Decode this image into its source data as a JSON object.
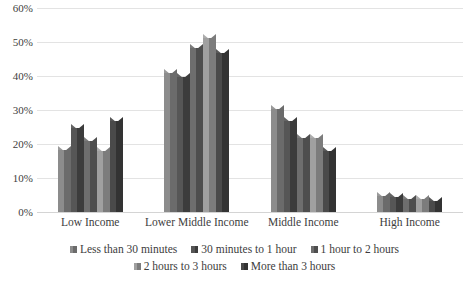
{
  "chart_data": {
    "type": "bar",
    "title": "",
    "subtitle": "",
    "xlabel": "",
    "ylabel": "",
    "ylim": [
      0,
      60
    ],
    "ytick_step": 10,
    "ytick_labels": [
      "0%",
      "10%",
      "20%",
      "30%",
      "40%",
      "50%",
      "60%"
    ],
    "ytick_values": [
      0,
      10,
      20,
      30,
      40,
      50,
      60
    ],
    "grid": true,
    "grid_axis": "y",
    "legend_position": "bottom",
    "categories": [
      "Low Income",
      "Lower Middle Income",
      "Middle Income",
      "High Income"
    ],
    "series": [
      {
        "name": "Less than 30 minutes",
        "values": [
          19.5,
          42.0,
          31.5,
          6.0
        ]
      },
      {
        "name": "30 minutes to 1 hour",
        "values": [
          26.0,
          41.0,
          28.0,
          5.5
        ]
      },
      {
        "name": "1 hour to 2 hours",
        "values": [
          22.0,
          49.5,
          23.0,
          5.0
        ]
      },
      {
        "name": "2 hours to 3 hours",
        "values": [
          19.0,
          52.5,
          23.0,
          5.0
        ]
      },
      {
        "name": "More than 3 hours",
        "values": [
          28.0,
          48.0,
          19.0,
          4.5
        ]
      }
    ]
  },
  "colors": {
    "series_light": [
      "#8c8c8c",
      "#565656",
      "#6e6e6e",
      "#a0a0a0",
      "#4a4a4a"
    ],
    "series_dark": [
      "#6b6b6b",
      "#3c3c3c",
      "#4e4e4e",
      "#7c7c7c",
      "#333333"
    ],
    "series_cap": [
      "#9a9a9a",
      "#646464",
      "#7c7c7c",
      "#adadad",
      "#585858"
    ],
    "gridline": "#e3e3e3",
    "axis_text": "#3f3f3f",
    "background": "#ffffff"
  }
}
